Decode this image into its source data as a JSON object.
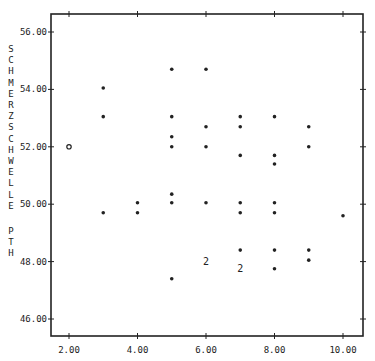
{
  "chart_data": {
    "type": "scatter",
    "title": "",
    "xlabel": "",
    "ylabel": "SCHMERZSCHWELLE PTH",
    "xlim": [
      1.5,
      10.6
    ],
    "ylim": [
      45.4,
      56.6
    ],
    "x_ticks": [
      "2.00",
      "4.00",
      "6.00",
      "8.00",
      "10.00"
    ],
    "x_tick_values": [
      2,
      4,
      6,
      8,
      10
    ],
    "y_ticks": [
      "46.00",
      "48.00",
      "50.00",
      "52.00",
      "54.00",
      "56.00"
    ],
    "y_tick_values": [
      46,
      48,
      50,
      52,
      54,
      56
    ],
    "grid": false,
    "legend": null,
    "frame": "box",
    "points": [
      {
        "x": 2,
        "y": 52.0,
        "marker": "o"
      },
      {
        "x": 3,
        "y": 54.05,
        "marker": "*"
      },
      {
        "x": 3,
        "y": 53.05,
        "marker": "*"
      },
      {
        "x": 3,
        "y": 49.7,
        "marker": "*"
      },
      {
        "x": 4,
        "y": 50.05,
        "marker": "*"
      },
      {
        "x": 4,
        "y": 49.7,
        "marker": "*"
      },
      {
        "x": 5,
        "y": 54.7,
        "marker": "*"
      },
      {
        "x": 5,
        "y": 53.05,
        "marker": "*"
      },
      {
        "x": 5,
        "y": 52.35,
        "marker": "*"
      },
      {
        "x": 5,
        "y": 52.0,
        "marker": "*"
      },
      {
        "x": 5,
        "y": 50.35,
        "marker": "*"
      },
      {
        "x": 5,
        "y": 50.05,
        "marker": "*"
      },
      {
        "x": 5,
        "y": 47.4,
        "marker": "*"
      },
      {
        "x": 6,
        "y": 54.7,
        "marker": "*"
      },
      {
        "x": 6,
        "y": 52.7,
        "marker": "*"
      },
      {
        "x": 6,
        "y": 52.0,
        "marker": "*"
      },
      {
        "x": 6,
        "y": 50.05,
        "marker": "*"
      },
      {
        "x": 6,
        "y": 48.0,
        "marker": "2"
      },
      {
        "x": 7,
        "y": 53.05,
        "marker": "*"
      },
      {
        "x": 7,
        "y": 52.7,
        "marker": "*"
      },
      {
        "x": 7,
        "y": 51.7,
        "marker": "*"
      },
      {
        "x": 7,
        "y": 50.05,
        "marker": "*"
      },
      {
        "x": 7,
        "y": 49.7,
        "marker": "*"
      },
      {
        "x": 7,
        "y": 48.4,
        "marker": "*"
      },
      {
        "x": 7,
        "y": 47.75,
        "marker": "2"
      },
      {
        "x": 8,
        "y": 53.05,
        "marker": "*"
      },
      {
        "x": 8,
        "y": 51.7,
        "marker": "*"
      },
      {
        "x": 8,
        "y": 51.4,
        "marker": "*"
      },
      {
        "x": 8,
        "y": 50.05,
        "marker": "*"
      },
      {
        "x": 8,
        "y": 49.7,
        "marker": "*"
      },
      {
        "x": 8,
        "y": 48.4,
        "marker": "*"
      },
      {
        "x": 8,
        "y": 47.75,
        "marker": "*"
      },
      {
        "x": 9,
        "y": 52.7,
        "marker": "*"
      },
      {
        "x": 9,
        "y": 52.0,
        "marker": "*"
      },
      {
        "x": 9,
        "y": 48.4,
        "marker": "*"
      },
      {
        "x": 9,
        "y": 48.05,
        "marker": "*"
      },
      {
        "x": 10,
        "y": 49.6,
        "marker": "*"
      }
    ]
  },
  "colors": {
    "ink": "#222222",
    "background": "#ffffff"
  }
}
